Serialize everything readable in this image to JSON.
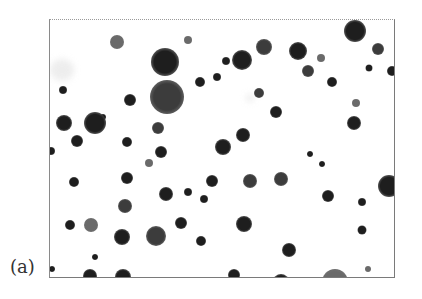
{
  "figure": {
    "panel_label": "(a)",
    "frame": {
      "x": 49,
      "y": 19,
      "width": 344,
      "height": 257
    },
    "colors": {
      "background": "#ffffff",
      "particle_dark": "#1e1e1e",
      "particle_mid": "#3c3c3c",
      "particle_light": "#6a6a6a",
      "frame_border": "#7a7a7a"
    },
    "particles": [
      {
        "x": 67,
        "y": 22,
        "d": 14,
        "tone": "light"
      },
      {
        "x": 115,
        "y": 42,
        "d": 28,
        "tone": "dark"
      },
      {
        "x": 138,
        "y": 20,
        "d": 8,
        "tone": "light"
      },
      {
        "x": 176,
        "y": 41,
        "d": 8,
        "tone": "dark"
      },
      {
        "x": 117,
        "y": 77,
        "d": 34,
        "tone": "mid"
      },
      {
        "x": 150,
        "y": 62,
        "d": 10,
        "tone": "dark"
      },
      {
        "x": 53,
        "y": 97,
        "d": 6,
        "tone": "dark"
      },
      {
        "x": 13,
        "y": 70,
        "d": 8,
        "tone": "dark"
      },
      {
        "x": 80,
        "y": 80,
        "d": 12,
        "tone": "dark"
      },
      {
        "x": 214,
        "y": 27,
        "d": 16,
        "tone": "mid"
      },
      {
        "x": 192,
        "y": 40,
        "d": 20,
        "tone": "dark"
      },
      {
        "x": 167,
        "y": 57,
        "d": 8,
        "tone": "dark"
      },
      {
        "x": 209,
        "y": 73,
        "d": 10,
        "tone": "mid"
      },
      {
        "x": 305,
        "y": 11,
        "d": 22,
        "tone": "dark"
      },
      {
        "x": 248,
        "y": 31,
        "d": 18,
        "tone": "dark"
      },
      {
        "x": 271,
        "y": 38,
        "d": 8,
        "tone": "light"
      },
      {
        "x": 258,
        "y": 51,
        "d": 12,
        "tone": "mid"
      },
      {
        "x": 282,
        "y": 62,
        "d": 10,
        "tone": "dark"
      },
      {
        "x": 328,
        "y": 29,
        "d": 12,
        "tone": "mid"
      },
      {
        "x": 319,
        "y": 48,
        "d": 7,
        "tone": "dark"
      },
      {
        "x": 342,
        "y": 51,
        "d": 10,
        "tone": "dark"
      },
      {
        "x": 45,
        "y": 103,
        "d": 22,
        "tone": "dark"
      },
      {
        "x": 14,
        "y": 103,
        "d": 16,
        "tone": "dark"
      },
      {
        "x": 108,
        "y": 108,
        "d": 12,
        "tone": "mid"
      },
      {
        "x": 27,
        "y": 121,
        "d": 12,
        "tone": "dark"
      },
      {
        "x": 193,
        "y": 115,
        "d": 14,
        "tone": "dark"
      },
      {
        "x": 226,
        "y": 92,
        "d": 12,
        "tone": "dark"
      },
      {
        "x": 173,
        "y": 127,
        "d": 16,
        "tone": "dark"
      },
      {
        "x": 1,
        "y": 131,
        "d": 8,
        "tone": "dark"
      },
      {
        "x": 77,
        "y": 122,
        "d": 10,
        "tone": "dark"
      },
      {
        "x": 111,
        "y": 132,
        "d": 12,
        "tone": "dark"
      },
      {
        "x": 304,
        "y": 103,
        "d": 14,
        "tone": "dark"
      },
      {
        "x": 306,
        "y": 83,
        "d": 8,
        "tone": "light"
      },
      {
        "x": 260,
        "y": 134,
        "d": 6,
        "tone": "dark"
      },
      {
        "x": 272,
        "y": 144,
        "d": 6,
        "tone": "dark"
      },
      {
        "x": 77,
        "y": 158,
        "d": 12,
        "tone": "dark"
      },
      {
        "x": 24,
        "y": 162,
        "d": 10,
        "tone": "dark"
      },
      {
        "x": 99,
        "y": 143,
        "d": 8,
        "tone": "light"
      },
      {
        "x": 138,
        "y": 172,
        "d": 8,
        "tone": "dark"
      },
      {
        "x": 162,
        "y": 161,
        "d": 12,
        "tone": "dark"
      },
      {
        "x": 200,
        "y": 161,
        "d": 14,
        "tone": "mid"
      },
      {
        "x": 116,
        "y": 174,
        "d": 14,
        "tone": "dark"
      },
      {
        "x": 339,
        "y": 166,
        "d": 22,
        "tone": "dark"
      },
      {
        "x": 231,
        "y": 159,
        "d": 14,
        "tone": "mid"
      },
      {
        "x": 312,
        "y": 182,
        "d": 8,
        "tone": "dark"
      },
      {
        "x": 278,
        "y": 176,
        "d": 12,
        "tone": "dark"
      },
      {
        "x": 75,
        "y": 186,
        "d": 14,
        "tone": "mid"
      },
      {
        "x": 154,
        "y": 179,
        "d": 8,
        "tone": "dark"
      },
      {
        "x": 20,
        "y": 205,
        "d": 10,
        "tone": "dark"
      },
      {
        "x": 41,
        "y": 205,
        "d": 14,
        "tone": "light"
      },
      {
        "x": 72,
        "y": 217,
        "d": 16,
        "tone": "dark"
      },
      {
        "x": 106,
        "y": 216,
        "d": 20,
        "tone": "mid"
      },
      {
        "x": 151,
        "y": 221,
        "d": 10,
        "tone": "dark"
      },
      {
        "x": 131,
        "y": 203,
        "d": 12,
        "tone": "dark"
      },
      {
        "x": 194,
        "y": 204,
        "d": 16,
        "tone": "dark"
      },
      {
        "x": 239,
        "y": 230,
        "d": 14,
        "tone": "dark"
      },
      {
        "x": 312,
        "y": 210,
        "d": 9,
        "tone": "dark"
      },
      {
        "x": 45,
        "y": 237,
        "d": 6,
        "tone": "dark"
      },
      {
        "x": 40,
        "y": 256,
        "d": 14,
        "tone": "dark"
      },
      {
        "x": 73,
        "y": 257,
        "d": 16,
        "tone": "dark"
      },
      {
        "x": 285,
        "y": 262,
        "d": 26,
        "tone": "light"
      },
      {
        "x": 184,
        "y": 255,
        "d": 12,
        "tone": "dark"
      },
      {
        "x": 231,
        "y": 262,
        "d": 16,
        "tone": "dark"
      },
      {
        "x": 318,
        "y": 249,
        "d": 6,
        "tone": "light"
      },
      {
        "x": 2,
        "y": 249,
        "d": 6,
        "tone": "dark"
      }
    ],
    "haze_spots": [
      {
        "x": 12,
        "y": 50,
        "w": 24,
        "h": 22
      },
      {
        "x": 200,
        "y": 78,
        "w": 8,
        "h": 8
      }
    ]
  }
}
